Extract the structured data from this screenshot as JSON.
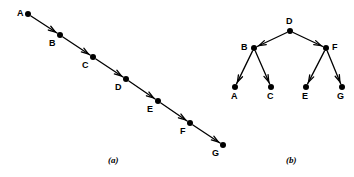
{
  "figure": {
    "width": 354,
    "height": 177,
    "background": "#ffffff",
    "ink_color": "#000000"
  },
  "panels": [
    {
      "id": "panel-a",
      "caption": "(a)",
      "caption_pos": {
        "x": 108,
        "y": 156
      },
      "type": "directed-chain",
      "description": "Linear chain of seven labelled nodes connected by directed edges running top-left to bottom-right",
      "nodes": [
        {
          "id": "A",
          "label": "A",
          "x": 28,
          "y": 14,
          "label_x": 17,
          "label_y": 9
        },
        {
          "id": "B",
          "label": "B",
          "x": 60,
          "y": 35,
          "label_x": 49,
          "label_y": 39
        },
        {
          "id": "C",
          "label": "C",
          "x": 93,
          "y": 57,
          "label_x": 82,
          "label_y": 61
        },
        {
          "id": "D",
          "label": "D",
          "x": 126,
          "y": 79,
          "label_x": 115,
          "label_y": 83
        },
        {
          "id": "E",
          "label": "E",
          "x": 158,
          "y": 101,
          "label_x": 147,
          "label_y": 105
        },
        {
          "id": "F",
          "label": "F",
          "x": 190,
          "y": 123,
          "label_x": 180,
          "label_y": 127
        },
        {
          "id": "G",
          "label": "G",
          "x": 223,
          "y": 145,
          "label_x": 212,
          "label_y": 149
        }
      ],
      "edges": [
        {
          "from": "A",
          "to": "B"
        },
        {
          "from": "B",
          "to": "C"
        },
        {
          "from": "C",
          "to": "D"
        },
        {
          "from": "D",
          "to": "E"
        },
        {
          "from": "E",
          "to": "F"
        },
        {
          "from": "F",
          "to": "G"
        }
      ]
    },
    {
      "id": "panel-b",
      "caption": "(b)",
      "caption_pos": {
        "x": 286,
        "y": 156
      },
      "type": "directed-tree",
      "description": "Balanced binary tree rooted at D with children B and F, and leaves A, C, E, G",
      "nodes": [
        {
          "id": "D",
          "label": "D",
          "x": 290,
          "y": 31,
          "label_x": 286,
          "label_y": 17
        },
        {
          "id": "B",
          "label": "B",
          "x": 254,
          "y": 48,
          "label_x": 241,
          "label_y": 43
        },
        {
          "id": "F",
          "label": "F",
          "x": 326,
          "y": 48,
          "label_x": 332,
          "label_y": 43
        },
        {
          "id": "A",
          "label": "A",
          "x": 235,
          "y": 87,
          "label_x": 231,
          "label_y": 92
        },
        {
          "id": "C",
          "label": "C",
          "x": 271,
          "y": 87,
          "label_x": 267,
          "label_y": 92
        },
        {
          "id": "E",
          "label": "E",
          "x": 306,
          "y": 87,
          "label_x": 302,
          "label_y": 92
        },
        {
          "id": "G",
          "label": "G",
          "x": 342,
          "y": 87,
          "label_x": 337,
          "label_y": 92
        }
      ],
      "edges": [
        {
          "from": "D",
          "to": "B"
        },
        {
          "from": "D",
          "to": "F"
        },
        {
          "from": "B",
          "to": "A"
        },
        {
          "from": "B",
          "to": "C"
        },
        {
          "from": "F",
          "to": "E"
        },
        {
          "from": "F",
          "to": "G"
        }
      ]
    }
  ],
  "style": {
    "node_radius": 3,
    "edge_width": 1.3,
    "arrow_length": 7,
    "arrow_width": 4.5
  }
}
